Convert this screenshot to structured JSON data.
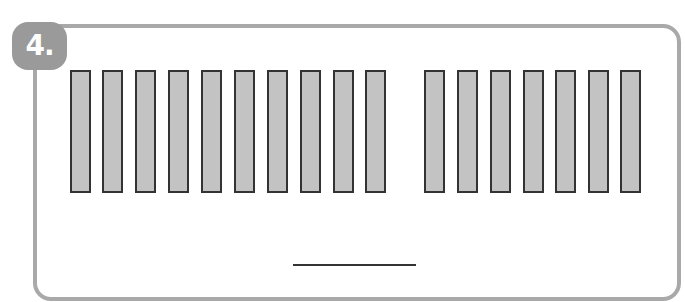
{
  "problem": {
    "number_label": "4.",
    "badge_color": "#9a9a9a",
    "frame_color": "#a9a9a9"
  },
  "bars": {
    "fill_color": "#c3c3c3",
    "border_color": "#333333",
    "groups": [
      {
        "name": "group-1",
        "count": 10,
        "x_positions": [
          70,
          102,
          135,
          168,
          201,
          234,
          267,
          300,
          333,
          365
        ]
      },
      {
        "name": "group-2",
        "count": 7,
        "x_positions": [
          424,
          457,
          490,
          523,
          555,
          588,
          620
        ]
      }
    ],
    "total_count": 17
  },
  "answer": {
    "value": ""
  }
}
